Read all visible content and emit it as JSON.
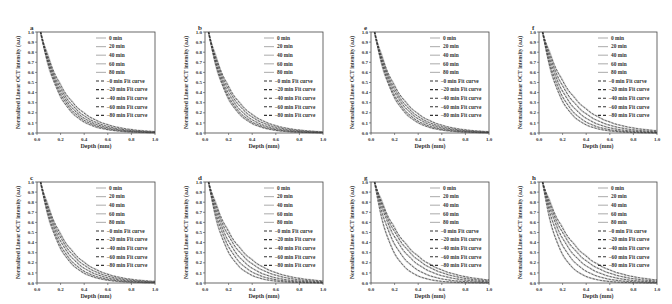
{
  "chart_data": [
    {
      "panel": "a",
      "type": "line",
      "xlabel": "Depth (mm)",
      "ylabel": "Normalized Linear OCT intensity (a.u)",
      "xlim": [
        0,
        1
      ],
      "ylim": [
        0,
        1
      ],
      "grid": false,
      "legend_position": "upper right",
      "xticks": [
        "0.0",
        "0.2",
        "0.4",
        "0.6",
        "0.8",
        "1.0"
      ],
      "yticks": [
        "0.0",
        "0.1",
        "0.2",
        "0.3",
        "0.4",
        "0.5",
        "0.6",
        "0.7",
        "0.8",
        "0.9",
        "1.0"
      ],
      "series": [
        {
          "name": "0 min",
          "style": "solid-gray",
          "decay_k": 6.0
        },
        {
          "name": "20 min",
          "style": "solid-gray",
          "decay_k": 5.6
        },
        {
          "name": "40 min",
          "style": "solid-gray",
          "decay_k": 5.2
        },
        {
          "name": "60 min",
          "style": "solid-gray",
          "decay_k": 4.8
        },
        {
          "name": "80 min",
          "style": "solid-gray",
          "decay_k": 4.4
        },
        {
          "name": "−0 min  Fit curve",
          "style": "dashed-dark",
          "decay_k": 6.0
        },
        {
          "name": "−20 min Fit curve",
          "style": "dashed-dark",
          "decay_k": 5.6
        },
        {
          "name": "−40 min Fit curve",
          "style": "dashed-dark",
          "decay_k": 5.2
        },
        {
          "name": "−60 min Fit curve",
          "style": "dashed-dark",
          "decay_k": 4.8
        },
        {
          "name": "−80 min Fit curve",
          "style": "dashed-dark",
          "decay_k": 4.4
        }
      ]
    },
    {
      "panel": "b",
      "type": "line",
      "xlabel": "Depth (mm)",
      "ylabel": "Normalized Linear OCT intensity (a.u)",
      "xlim": [
        0,
        1
      ],
      "ylim": [
        0,
        1
      ],
      "series_decay_k": [
        6.4,
        6.0,
        5.5,
        5.0,
        4.6
      ]
    },
    {
      "panel": "e",
      "type": "line",
      "xlabel": "Depth (mm)",
      "ylabel": "Normalized Linear OCT intensity (a.u)",
      "xlim": [
        0,
        1
      ],
      "ylim": [
        0,
        1
      ],
      "series_decay_k": [
        6.2,
        5.8,
        5.3,
        4.9,
        4.5
      ]
    },
    {
      "panel": "f",
      "type": "line",
      "xlabel": "Depth (mm)",
      "ylabel": "Normalized Linear OCT intensity (a.u)",
      "xlim": [
        0,
        1
      ],
      "ylim": [
        0,
        1
      ],
      "series_decay_k": [
        6.8,
        6.0,
        5.2,
        4.5,
        3.9
      ]
    },
    {
      "panel": "c",
      "type": "line",
      "xlabel": "Depth (mm)",
      "ylabel": "Normalized Linear OCT intensity (a.u)",
      "xlim": [
        0,
        1
      ],
      "ylim": [
        0,
        1
      ],
      "series_decay_k": [
        6.3,
        5.8,
        5.2,
        4.7,
        4.3
      ]
    },
    {
      "panel": "d",
      "type": "line",
      "xlabel": "Depth (mm)",
      "ylabel": "Normalized Linear OCT intensity (a.u)",
      "xlim": [
        0,
        1
      ],
      "ylim": [
        0,
        1
      ],
      "series_decay_k": [
        7.0,
        6.0,
        5.2,
        4.5,
        4.0
      ]
    },
    {
      "panel": "g",
      "type": "line",
      "xlabel": "Depth (mm)",
      "ylabel": "Normalized Linear OCT intensity (a.u)",
      "xlim": [
        0,
        1
      ],
      "ylim": [
        0,
        1
      ],
      "series_decay_k": [
        7.2,
        5.6,
        4.6,
        4.0,
        3.6
      ]
    },
    {
      "panel": "h",
      "type": "line",
      "xlabel": "Depth (mm)",
      "ylabel": "Normalized Linear OCT intensity (a.u)",
      "xlim": [
        0,
        1
      ],
      "ylim": [
        0,
        1
      ],
      "series_decay_k": [
        7.4,
        5.8,
        4.8,
        4.1,
        3.6
      ]
    }
  ],
  "common": {
    "xlabel": "Depth (mm)",
    "ylabel": "Normalized Linear OCT intensity (a.u)",
    "xticks": [
      "0.0",
      "0.2",
      "0.4",
      "0.6",
      "0.8",
      "1.0"
    ],
    "yticks": [
      "0.0",
      "0.1",
      "0.2",
      "0.3",
      "0.4",
      "0.5",
      "0.6",
      "0.7",
      "0.8",
      "0.9",
      "1.0"
    ],
    "legend": [
      "0 min",
      "20 min",
      "40 min",
      "60 min",
      "80 min",
      "−0 min  Fit curve",
      "−20 min Fit curve",
      "−40 min Fit curve",
      "−60 min Fit curve",
      "−80 min Fit curve"
    ],
    "colors": {
      "data": "#b8b8b8",
      "fit": "#333333",
      "axis": "#444444"
    }
  },
  "panels": [
    {
      "id": "a",
      "x": 0,
      "y": 0
    },
    {
      "id": "b",
      "x": 168,
      "y": 0
    },
    {
      "id": "e",
      "x": 334,
      "y": 0
    },
    {
      "id": "f",
      "x": 502,
      "y": 0
    },
    {
      "id": "c",
      "x": 0,
      "y": 150
    },
    {
      "id": "d",
      "x": 168,
      "y": 150
    },
    {
      "id": "g",
      "x": 334,
      "y": 150
    },
    {
      "id": "h",
      "x": 502,
      "y": 150
    }
  ]
}
